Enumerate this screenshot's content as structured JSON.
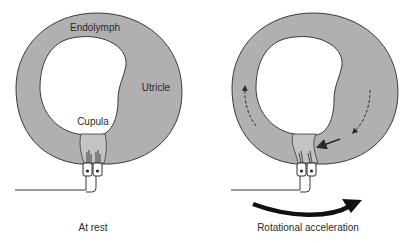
{
  "colors": {
    "fluid_gray": "#b0b0b0",
    "cupula_gray": "#c4c4c4",
    "outline": "#3a3a3a",
    "hair_dark": "#555555",
    "background": "#ffffff"
  },
  "panels": [
    {
      "id": "at-rest",
      "caption": "At rest",
      "labels": {
        "endolymph": "Endolymph",
        "utricle": "Utricle",
        "cupula": "Cupula"
      }
    },
    {
      "id": "rotational-acceleration",
      "caption": "Rotational acceleration",
      "arrows": [
        {
          "name": "endolymph-flow-left",
          "style": "dashed",
          "direction": "up"
        },
        {
          "name": "endolymph-flow-right",
          "style": "dashed",
          "direction": "down-left"
        },
        {
          "name": "cupula-push-arrow",
          "style": "solid",
          "direction": "left"
        },
        {
          "name": "rotation-direction-arrow",
          "style": "thick-curved",
          "direction": "right"
        }
      ]
    }
  ]
}
